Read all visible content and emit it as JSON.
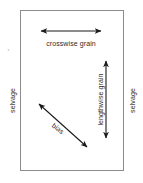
{
  "diagram": {
    "background_color": "#ffffff",
    "fabric": {
      "name": "fabric-rectangle",
      "border_color": "#8c8c8c",
      "fill_color": "#ffffff",
      "x": 20,
      "y": 10,
      "width": 104,
      "height": 161
    },
    "arrow_color": "#1a1a1a",
    "labels": {
      "crosswise_grain": "crosswise grain",
      "lengthwise_grain": "lengthwise grain",
      "bias": "bias",
      "selvage_left": "selvage",
      "selvage_right": "selvage"
    },
    "arrows": [
      {
        "name": "crosswise-grain-arrow",
        "orientation": "horizontal",
        "double_headed": true,
        "x1": 40,
        "y1": 31,
        "x2": 102,
        "y2": 31
      },
      {
        "name": "lengthwise-grain-arrow",
        "orientation": "vertical",
        "double_headed": true,
        "x1": 106,
        "y1": 60,
        "x2": 106,
        "y2": 139
      },
      {
        "name": "bias-arrow",
        "orientation": "diagonal",
        "double_headed": true,
        "x1": 38,
        "y1": 103,
        "x2": 88,
        "y2": 148
      }
    ]
  }
}
